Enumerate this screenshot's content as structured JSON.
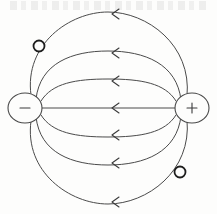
{
  "figure": {
    "background_color": "#fdfdfc",
    "line_color": "#4a4a4a",
    "arrow_color": "#3b3b3b",
    "width": 217,
    "height": 214
  },
  "charges": [
    {
      "id": "negative-charge",
      "sign": "−",
      "polarity": "negative",
      "cx": 25,
      "cy": 108,
      "rx": 17,
      "ry": 15
    },
    {
      "id": "positive-charge",
      "sign": "+",
      "polarity": "positive",
      "cx": 192,
      "cy": 108,
      "rx": 17,
      "ry": 15
    }
  ],
  "test_charges": [
    {
      "id": "test-charge-upper-left",
      "cx": 39,
      "cy": 46,
      "r": 5.5
    },
    {
      "id": "test-charge-lower-right",
      "cx": 180,
      "cy": 172,
      "r": 5.5
    }
  ],
  "field_lines": [
    {
      "id": "field-line-outer-top",
      "path": "M 31 95 C 24 44 70 12 108 12 C 147 12 192 45 187 96",
      "arrow": {
        "x": 112,
        "y": 14,
        "direction": "left"
      }
    },
    {
      "id": "field-line-mid-top",
      "path": "M 36 99 C 40 63 72 51 108 51 C 145 51 177 64 181 100",
      "arrow": {
        "x": 112,
        "y": 53,
        "direction": "left"
      }
    },
    {
      "id": "field-line-inner-top",
      "path": "M 41 101 C 52 83 76 79 108 79 C 141 79 165 83 176 101",
      "arrow": {
        "x": 112,
        "y": 81,
        "direction": "left"
      }
    },
    {
      "id": "field-line-axis",
      "path": "M 42 108 L 175 108",
      "arrow": {
        "x": 112,
        "y": 108,
        "direction": "left"
      }
    },
    {
      "id": "field-line-inner-bottom",
      "path": "M 41 115 C 52 133 76 137 108 137 C 141 137 165 133 176 115",
      "arrow": {
        "x": 112,
        "y": 135,
        "direction": "left"
      }
    },
    {
      "id": "field-line-mid-bottom",
      "path": "M 36 117 C 40 153 72 165 108 165 C 145 165 177 152 181 116",
      "arrow": {
        "x": 112,
        "y": 163,
        "direction": "left"
      }
    },
    {
      "id": "field-line-outer-bottom",
      "path": "M 31 121 C 24 172 70 204 108 204 C 147 204 192 171 187 120",
      "arrow": {
        "x": 112,
        "y": 202,
        "direction": "left"
      }
    }
  ]
}
